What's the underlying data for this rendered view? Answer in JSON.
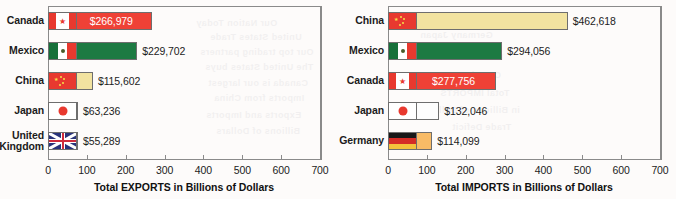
{
  "figure": {
    "background_color": "#fdfbfa",
    "frame_color": "#8a8a8a"
  },
  "ghost_text": [
    {
      "text": "Our Nation Today",
      "x": 196,
      "y": 18,
      "size": 9
    },
    {
      "text": "United States Trade",
      "x": 210,
      "y": 32,
      "size": 9
    },
    {
      "text": "Our top trading partners",
      "x": 200,
      "y": 47,
      "size": 9
    },
    {
      "text": "The United States buys",
      "x": 205,
      "y": 62,
      "size": 9
    },
    {
      "text": "Canada is our largest",
      "x": 208,
      "y": 78,
      "size": 9
    },
    {
      "text": "Imports from China",
      "x": 214,
      "y": 93,
      "size": 9
    },
    {
      "text": "Exports and Imports",
      "x": 206,
      "y": 110,
      "size": 9
    },
    {
      "text": "Billions of Dollars",
      "x": 216,
      "y": 126,
      "size": 9
    },
    {
      "text": "Germany Japan",
      "x": 420,
      "y": 30,
      "size": 9
    },
    {
      "text": "Mexico",
      "x": 470,
      "y": 52,
      "size": 9
    },
    {
      "text": "Canada",
      "x": 466,
      "y": 70,
      "size": 9
    },
    {
      "text": "Total IMPORTS",
      "x": 440,
      "y": 88,
      "size": 9
    },
    {
      "text": "in Billions of Dollars",
      "x": 424,
      "y": 105,
      "size": 9
    },
    {
      "text": "Trade Deficit",
      "x": 452,
      "y": 122,
      "size": 9
    }
  ],
  "charts": [
    {
      "id": "exports-chart",
      "axis_title": "Total EXPORTS in Billions of Dollars",
      "x_ticks": [
        "0",
        "100",
        "200",
        "300",
        "400",
        "500",
        "600",
        "700"
      ],
      "chart_data": {
        "type": "bar",
        "orientation": "horizontal",
        "title": "",
        "xlabel": "Total EXPORTS in Billions of Dollars",
        "ylabel": "",
        "xlim": [
          0,
          700
        ],
        "grid": false,
        "legend": "none",
        "categories": [
          "Canada",
          "Mexico",
          "China",
          "Japan",
          "United Kingdom"
        ],
        "values": [
          266.979,
          229.702,
          115.602,
          63.236,
          55.289
        ],
        "value_labels": [
          "$266,979",
          "$229,702",
          "$115,602",
          "$63,236",
          "$55,289"
        ],
        "bar_colors": [
          "#ef4136",
          "#1d7a42",
          "#f2e3a0",
          "#fdfdfd",
          "#29337a"
        ],
        "label_placement": [
          "inside",
          "outside",
          "outside",
          "outside",
          "outside"
        ]
      },
      "bars": [
        {
          "country": "Canada",
          "label": "Canada",
          "value_label": "$266,979",
          "value": 266.979,
          "flag": "canada-flag",
          "color": "#ef4136",
          "label_inside": true
        },
        {
          "country": "Mexico",
          "label": "Mexico",
          "value_label": "$229,702",
          "value": 229.702,
          "flag": "mexico-flag",
          "color": "#1d7a42",
          "label_inside": false
        },
        {
          "country": "China",
          "label": "China",
          "value_label": "$115,602",
          "value": 115.602,
          "flag": "china-flag",
          "color": "#f2e3a0",
          "label_inside": false
        },
        {
          "country": "Japan",
          "label": "Japan",
          "value_label": "$63,236",
          "value": 63.236,
          "flag": "japan-flag",
          "color": "#fdfdfd",
          "label_inside": false
        },
        {
          "country": "United Kingdom",
          "label": "United\nKingdom",
          "value_label": "$55,289",
          "value": 55.289,
          "flag": "united-kingdom-flag",
          "color": "#29337a",
          "label_inside": false
        }
      ]
    },
    {
      "id": "imports-chart",
      "axis_title": "Total IMPORTS in Billions of Dollars",
      "x_ticks": [
        "0",
        "100",
        "200",
        "300",
        "400",
        "500",
        "600",
        "700"
      ],
      "chart_data": {
        "type": "bar",
        "orientation": "horizontal",
        "title": "",
        "xlabel": "Total IMPORTS in Billions of Dollars",
        "ylabel": "",
        "xlim": [
          0,
          700
        ],
        "grid": false,
        "legend": "none",
        "categories": [
          "China",
          "Mexico",
          "Canada",
          "Japan",
          "Germany"
        ],
        "values": [
          462.618,
          294.056,
          277.756,
          132.046,
          114.099
        ],
        "value_labels": [
          "$462,618",
          "$294,056",
          "$277,756",
          "$132,046",
          "$114,099"
        ],
        "bar_colors": [
          "#f2e3a0",
          "#1d7a42",
          "#ef4136",
          "#fdfdfd",
          "#f8bb66"
        ],
        "label_placement": [
          "outside",
          "outside",
          "inside",
          "outside",
          "outside"
        ]
      },
      "bars": [
        {
          "country": "China",
          "label": "China",
          "value_label": "$462,618",
          "value": 462.618,
          "flag": "china-flag",
          "color": "#f2e3a0",
          "label_inside": false
        },
        {
          "country": "Mexico",
          "label": "Mexico",
          "value_label": "$294,056",
          "value": 294.056,
          "flag": "mexico-flag",
          "color": "#1d7a42",
          "label_inside": false
        },
        {
          "country": "Canada",
          "label": "Canada",
          "value_label": "$277,756",
          "value": 277.756,
          "flag": "canada-flag",
          "color": "#ef4136",
          "label_inside": true
        },
        {
          "country": "Japan",
          "label": "Japan",
          "value_label": "$132,046",
          "value": 132.046,
          "flag": "japan-flag",
          "color": "#fdfdfd",
          "label_inside": false
        },
        {
          "country": "Germany",
          "label": "Germany",
          "value_label": "$114,099",
          "value": 114.099,
          "flag": "germany-flag",
          "color": "#f8bb66",
          "label_inside": false
        }
      ]
    }
  ]
}
